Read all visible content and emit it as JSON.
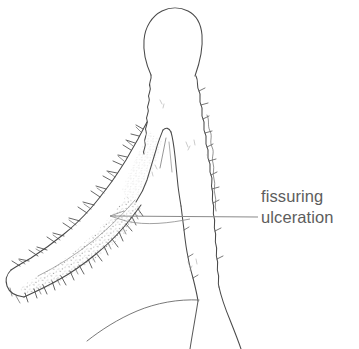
{
  "figure": {
    "kind": "medical-line-illustration",
    "background_color": "#ffffff",
    "ink_color": "#4a4a4a",
    "stipple_color": "#8d8d8d",
    "width": 359,
    "height": 349
  },
  "annotation": {
    "line1": "fissuring",
    "line2": "ulceration",
    "text_color": "#5d5d5d",
    "leader": {
      "color": "#8a8a8a",
      "x_start": 110,
      "x_end": 258,
      "y": 217
    }
  },
  "structures": [
    {
      "name": "villus-dome",
      "label": "rounded mucosal tip"
    },
    {
      "name": "fissure-cleft",
      "label": "fissure"
    },
    {
      "name": "ulceration-band",
      "label": "ulcerated diagonal band"
    },
    {
      "name": "right-wall",
      "label": "right mucosal contour"
    },
    {
      "name": "basal-curve",
      "label": "basal sweeping contour"
    }
  ]
}
